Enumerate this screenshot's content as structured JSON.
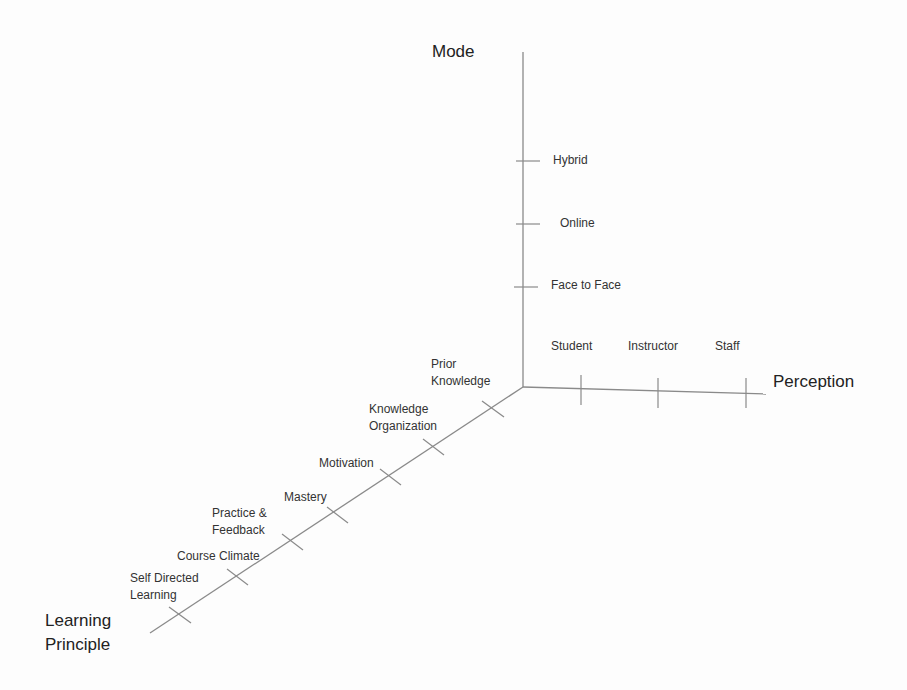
{
  "diagram": {
    "type": "3d-axes-framework",
    "axes": {
      "mode": {
        "title": "Mode",
        "ticks": [
          "Face to Face",
          "Online",
          "Hybrid"
        ]
      },
      "perception": {
        "title": "Perception",
        "ticks": [
          "Student",
          "Instructor",
          "Staff"
        ]
      },
      "learning_principle": {
        "title_line1": "Learning",
        "title_line2": "Principle",
        "ticks": [
          {
            "line1": "Prior",
            "line2": "Knowledge"
          },
          {
            "line1": "Knowledge",
            "line2": "Organization"
          },
          {
            "line1": "Motivation",
            "line2": ""
          },
          {
            "line1": "Mastery",
            "line2": ""
          },
          {
            "line1": "Practice &",
            "line2": "Feedback"
          },
          {
            "line1": "Course Climate",
            "line2": ""
          },
          {
            "line1": "Self Directed",
            "line2": "Learning"
          }
        ]
      }
    },
    "colors": {
      "background": "#fdfdfd",
      "axis": "#8a8a8a",
      "text": "#333333"
    }
  }
}
